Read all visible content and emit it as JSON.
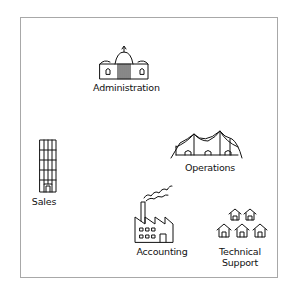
{
  "diagram": {
    "type": "hand-drawn organizational map",
    "nodes": [
      {
        "id": "administration",
        "label": "Administration",
        "icon": "capitol-building-icon"
      },
      {
        "id": "operations",
        "label": "Operations",
        "icon": "circus-tent-icon"
      },
      {
        "id": "sales",
        "label": "Sales",
        "icon": "skyscraper-icon"
      },
      {
        "id": "accounting",
        "label": "Accounting",
        "icon": "factory-icon"
      },
      {
        "id": "technical_support",
        "label_line1": "Technical",
        "label_line2": "Support",
        "icon": "houses-cluster-icon"
      }
    ],
    "colors": {
      "stroke": "#111111",
      "frame": "#a8a8a8",
      "background": "#ffffff"
    }
  }
}
